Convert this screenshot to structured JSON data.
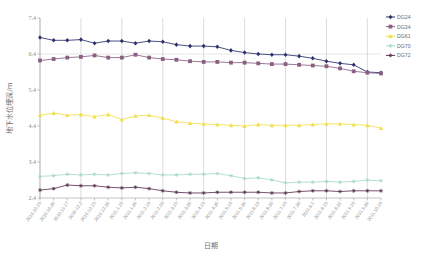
{
  "chart_data": {
    "type": "line",
    "title": "",
    "xlabel": "日期",
    "ylabel": "地下水位埋深/m",
    "ylim": [
      2.4,
      7.4
    ],
    "yticks": [
      2.4,
      3.4,
      4.4,
      5.4,
      6.4,
      7.4
    ],
    "grid": "vertical-major",
    "legend_position": "right",
    "categories": [
      "2010.10.15",
      "2010.10.30",
      "2010.11.17",
      "2010.12.2",
      "2010.12.15",
      "2010.12.30",
      "2011.1.15",
      "2011.1.30",
      "2011.2.15",
      "2011.2.28",
      "2011.3.15",
      "2011.3.30",
      "2011.4.15",
      "2011.4.30",
      "2011.5.15",
      "2011.5.30",
      "2011.6.15",
      "2011.6.30",
      "2011.7.15",
      "2011.7.30",
      "2011.8.1",
      "2011.8.15",
      "2011.8.31",
      "2011.9.15",
      "2011.9.30",
      "2011.10.15"
    ],
    "series": [
      {
        "name": "DG24",
        "color": "#2b2f6e",
        "marker": "diamond",
        "values": [
          6.86,
          6.78,
          6.78,
          6.8,
          6.7,
          6.76,
          6.76,
          6.7,
          6.76,
          6.74,
          6.66,
          6.62,
          6.62,
          6.6,
          6.5,
          6.44,
          6.4,
          6.38,
          6.38,
          6.34,
          6.28,
          6.2,
          6.14,
          6.1,
          5.9,
          5.88
        ]
      },
      {
        "name": "DG34",
        "color": "#8a5f84",
        "marker": "square",
        "values": [
          6.22,
          6.26,
          6.3,
          6.32,
          6.36,
          6.3,
          6.3,
          6.38,
          6.3,
          6.26,
          6.24,
          6.2,
          6.18,
          6.18,
          6.16,
          6.16,
          6.14,
          6.12,
          6.12,
          6.1,
          6.08,
          6.06,
          6.0,
          5.92,
          5.88,
          5.86
        ]
      },
      {
        "name": "DG61",
        "color": "#efe04a",
        "marker": "triangle",
        "values": [
          4.7,
          4.76,
          4.7,
          4.72,
          4.66,
          4.72,
          4.58,
          4.68,
          4.7,
          4.62,
          4.52,
          4.48,
          4.46,
          4.44,
          4.42,
          4.4,
          4.44,
          4.42,
          4.42,
          4.42,
          4.44,
          4.46,
          4.46,
          4.44,
          4.42,
          4.34
        ]
      },
      {
        "name": "DG70",
        "color": "#a8d8cc",
        "marker": "star",
        "values": [
          3.0,
          3.02,
          3.06,
          3.04,
          3.06,
          3.04,
          3.08,
          3.1,
          3.08,
          3.04,
          3.04,
          3.06,
          3.06,
          3.08,
          3.02,
          2.94,
          2.96,
          2.9,
          2.82,
          2.84,
          2.84,
          2.86,
          2.84,
          2.86,
          2.9,
          2.88
        ]
      },
      {
        "name": "DG72",
        "color": "#5a3550",
        "marker": "star",
        "values": [
          2.62,
          2.66,
          2.76,
          2.74,
          2.74,
          2.7,
          2.68,
          2.7,
          2.66,
          2.6,
          2.56,
          2.54,
          2.54,
          2.56,
          2.56,
          2.56,
          2.56,
          2.54,
          2.54,
          2.58,
          2.6,
          2.6,
          2.58,
          2.6,
          2.6,
          2.6
        ]
      }
    ]
  }
}
